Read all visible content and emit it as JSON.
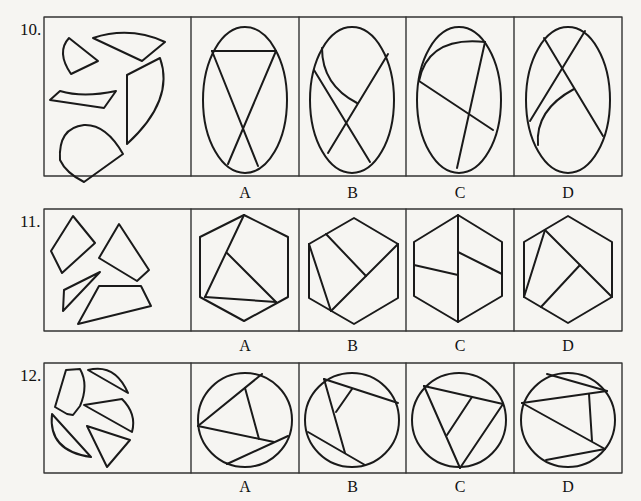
{
  "page": {
    "background": "#f6f5f2",
    "stroke_color": "#1a1a1a"
  },
  "questions": [
    {
      "number": "10.",
      "task": "assemble pieces into ellipse",
      "row_box": {
        "x": 44,
        "y": 17,
        "w": 578,
        "h": 159
      },
      "dividers_x": [
        191,
        299,
        406,
        514
      ],
      "pieces": [
        "M 69 38 Q 56 52 71 74 L 98 61 Z",
        "M 93 38 Q 130 26 165 42 L 142 61 Z",
        "M 50 100 L 60 91 Q 83 98 116 91 L 104 108 Z",
        "M 127 75 L 160 58 Q 175 100 127 144 Z",
        "M 84 125 Q 58 128 60 160 Q 66 173 84 182 L 123 154 Q 106 124 84 125 Z"
      ],
      "options": [
        {
          "label": "A",
          "shape": {
            "type": "ellipse",
            "cx": 245,
            "cy": 100,
            "rx": 42,
            "ry": 73
          },
          "lines": [
            "M 212 51 L 276 51",
            "M 212 51 L 258 166",
            "M 276 51 L 228 164"
          ]
        },
        {
          "label": "B",
          "shape": {
            "type": "ellipse",
            "cx": 352,
            "cy": 100,
            "rx": 42,
            "ry": 73
          },
          "lines": [
            "M 322 48 Q 322 85 357 103",
            "M 314 70 L 370 162",
            "M 388 54 L 328 153"
          ]
        },
        {
          "label": "C",
          "shape": {
            "type": "ellipse",
            "cx": 459,
            "cy": 100,
            "rx": 42,
            "ry": 73
          },
          "lines": [
            "M 419 81 Q 428 36 485 42",
            "M 485 42 L 457 168",
            "M 419 81 L 493 130"
          ]
        },
        {
          "label": "D",
          "shape": {
            "type": "ellipse",
            "cx": 568,
            "cy": 100,
            "rx": 42,
            "ry": 73
          },
          "lines": [
            "M 544 38 L 603 136",
            "M 585 31 L 530 121",
            "M 574 89 Q 535 110 538 145"
          ]
        }
      ],
      "label_y": 193
    },
    {
      "number": "11.",
      "task": "assemble pieces into hexagon",
      "row_box": {
        "x": 44,
        "y": 209,
        "w": 578,
        "h": 122
      },
      "dividers_x": [
        191,
        299,
        406,
        514
      ],
      "pieces": [
        "M 73 216 L 95 243 L 62 273 L 51 251 Z",
        "M 119 224 L 149 270 L 137 281 L 99 258 Z",
        "M 100 272 L 64 290 L 63 311 Z",
        "M 99 286 L 141 286 L 151 306 L 78 324 Z"
      ],
      "options": [
        {
          "label": "A",
          "shape": {
            "type": "polygon",
            "points": "244,215 288,237 288,297 244,321 200,297 200,237"
          },
          "lines": [
            "M 244 215 L 205 297",
            "M 227 253 L 276 302",
            "M 205 297 L 276 302"
          ]
        },
        {
          "label": "B",
          "shape": {
            "type": "polygon",
            "points": "354,218 398,244 398,298 354,324 309,298 309,244"
          },
          "lines": [
            "M 309 244 L 331 311",
            "M 331 311 L 398 244",
            "M 326 234 L 366 276"
          ]
        },
        {
          "label": "C",
          "shape": {
            "type": "polygon",
            "points": "458,215 502,242 502,296 458,322 414,296 414,242"
          },
          "lines": [
            "M 458 215 L 458 322",
            "M 414 265 L 458 275",
            "M 458 252 L 502 274"
          ]
        },
        {
          "label": "D",
          "shape": {
            "type": "polygon",
            "points": "568,216 612,242 612,297 568,323 524,297 524,242"
          },
          "lines": [
            "M 545 230 L 524 297",
            "M 545 230 L 612 297",
            "M 580 265 L 541 307"
          ]
        }
      ],
      "label_y": 346
    },
    {
      "number": "12.",
      "task": "assemble pieces into circle",
      "row_box": {
        "x": 44,
        "y": 363,
        "w": 578,
        "h": 110
      },
      "dividers_x": [
        191,
        299,
        406,
        514
      ],
      "pieces": [
        "M 66 370 L 80 369 Q 89 385 80 406 L 73 415 L 67 414 L 55 407 Z",
        "M 88 370 Q 115 363 128 393 Z",
        "M 84 405 L 122 399 Q 137 414 132 432 Z",
        "M 52 414 Q 48 451 91 457 Z",
        "M 87 426 L 130 440 L 107 467 Z"
      ],
      "options": [
        {
          "label": "A",
          "shape": {
            "type": "circle",
            "cx": 245,
            "cy": 420,
            "r": 47
          },
          "lines": [
            "M 198 426 L 262 374",
            "M 198 426 L 274 442",
            "M 245 388 L 259 439",
            "M 227 464 L 288 436"
          ]
        },
        {
          "label": "B",
          "shape": {
            "type": "circle",
            "cx": 352,
            "cy": 420,
            "r": 47
          },
          "lines": [
            "M 324 379 L 398 403",
            "M 324 379 L 345 453",
            "M 336 412 L 352 389",
            "M 308 432 L 365 465"
          ]
        },
        {
          "label": "C",
          "shape": {
            "type": "circle",
            "cx": 459,
            "cy": 420,
            "r": 47
          },
          "lines": [
            "M 424 386 L 503 404",
            "M 424 386 L 460 468",
            "M 503 404 L 460 468",
            "M 447 435 L 472 397"
          ]
        },
        {
          "label": "D",
          "shape": {
            "type": "circle",
            "cx": 568,
            "cy": 420,
            "r": 47
          },
          "lines": [
            "M 522 403 L 607 391",
            "M 522 403 L 605 449",
            "M 547 374 L 607 391",
            "M 589 394 L 592 441",
            "M 546 460 L 605 449"
          ]
        }
      ],
      "label_y": 487
    }
  ]
}
